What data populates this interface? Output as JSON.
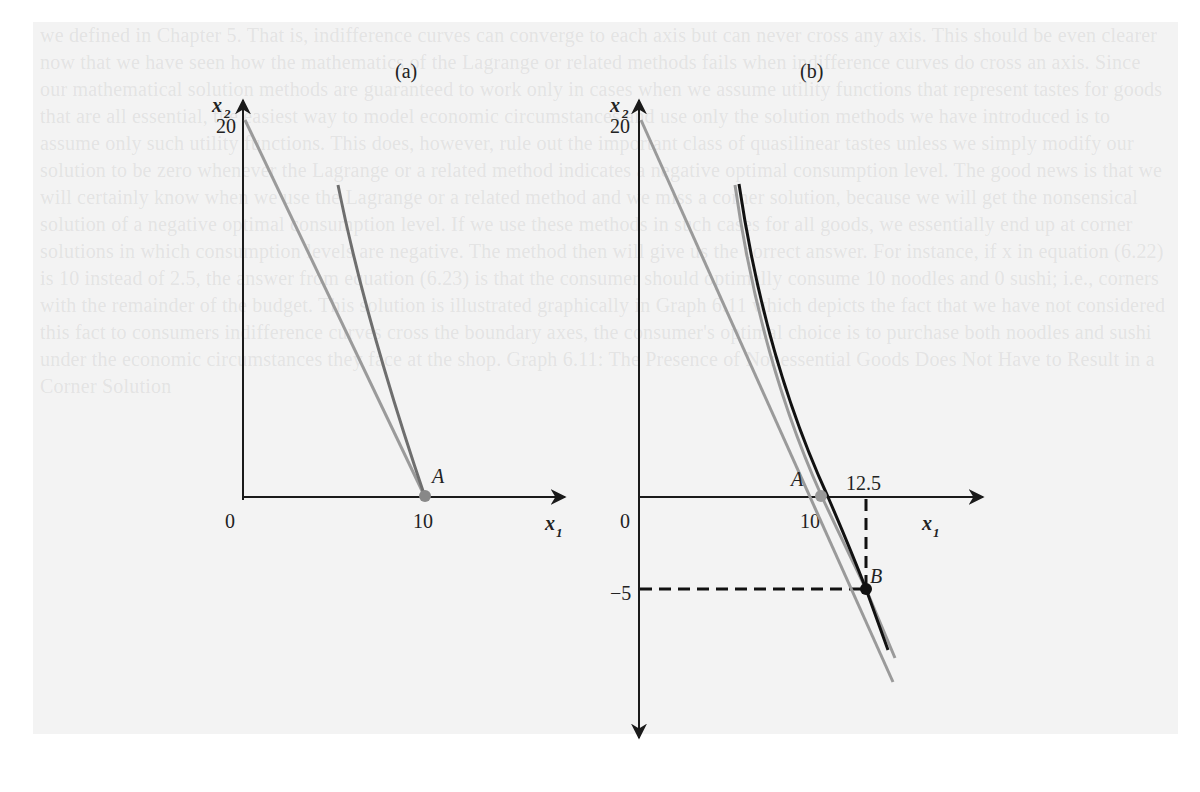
{
  "background_text": "we defined in Chapter 5. That is, indifference curves can converge to each axis but can never cross any axis. This should be even clearer now that we have seen how the mathematics of the Lagrange or related methods fails when indifference curves do cross an axis. Since our mathematical solution methods are guaranteed to work only in cases when we assume utility functions that represent tastes for goods that are all essential, the easiest way to model economic circumstances and use only the solution methods we have introduced is to assume only such utility functions. This does, however, rule out the important class of quasilinear tastes unless we simply modify our solution to be zero whenever the Lagrange or a related method indicates a negative optimal consumption level. The good news is that we will certainly know when we use the Lagrange or a related method and we miss a corner solution, because we will get the nonsensical solution of a negative optimal consumption level. If we use these methods in such cases for all goods, we essentially end up at corner solutions in which consumption levels are negative. The method then will give us the correct answer. For instance, if x in equation (6.22) is 10 instead of 2.5, the answer from equation (6.23) is that the consumer should optimally consume 10 noodles and 0 sushi; i.e., corners with the remainder of the budget. This solution is illustrated graphically in Graph 6.11 which depicts the fact that we have not considered this fact to consumers indifference curves cross the boundary axes, the consumer's optimal choice is to purchase both noodles and sushi under the economic circumstances they face at the shop. Graph 6.11: The Presence of Nonessential Goods Does Not Have to Result in a Corner Solution",
  "panels": [
    {
      "id": "a",
      "label": "(a)",
      "y_axis_label": "x",
      "y_axis_sub": "2",
      "x_axis_label": "x",
      "x_axis_sub": "1",
      "origin_label": "0",
      "y_tick": "20",
      "x_tick": "10",
      "point_label": "A",
      "colors": {
        "budget_line": "#9a9a9a",
        "indifference_curve": "#6e6e6e",
        "axis": "#1a1a1a",
        "point": "#888888"
      }
    },
    {
      "id": "b",
      "label": "(b)",
      "y_axis_label": "x",
      "y_axis_sub": "2",
      "x_axis_label": "x",
      "x_axis_sub": "1",
      "origin_label": "0",
      "y_tick": "20",
      "y_tick_neg": "−5",
      "x_tick": "10",
      "x_tick_2": "12.5",
      "point_a_label": "A",
      "point_b_label": "B",
      "colors": {
        "budget_line": "#9a9a9a",
        "indifference_curve": "#111111",
        "axis": "#1a1a1a",
        "point": "#111111"
      }
    }
  ]
}
